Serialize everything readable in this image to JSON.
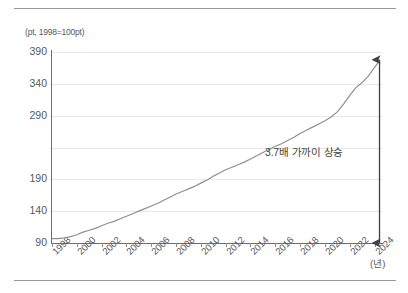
{
  "chart_data": {
    "type": "line",
    "title": "",
    "subtitle": "",
    "ylabel": "(pt, 1998=100pt)",
    "xlabel": "(년)",
    "xlim": [
      1998,
      2024.6
    ],
    "ylim": [
      90,
      390
    ],
    "grid": true,
    "legend": null,
    "y_ticks": [
      {
        "label": "390",
        "value": 390
      },
      {
        "label": "340",
        "value": 340
      },
      {
        "label": "290",
        "value": 290
      },
      {
        "label": "190",
        "value": 190
      },
      {
        "label": "140",
        "value": 140
      },
      {
        "label": "90",
        "value": 90
      }
    ],
    "y_gridline_values": [
      390,
      340,
      290,
      240,
      190,
      140,
      90
    ],
    "x_ticks": [
      "1998",
      "2000",
      "2002",
      "2004",
      "2006",
      "2008",
      "2010",
      "2012",
      "2014",
      "2016",
      "2018",
      "2020",
      "2022",
      "2024"
    ],
    "x_tick_values": [
      1998,
      2000,
      2002,
      2004,
      2006,
      2008,
      2010,
      2012,
      2014,
      2016,
      2018,
      2020,
      2022,
      2024
    ],
    "series": [
      {
        "name": "지수",
        "color": "#8f8f91",
        "x": [
          1998.0,
          1998.5,
          1999.0,
          1999.5,
          2000.0,
          2000.5,
          2001.0,
          2001.5,
          2002.0,
          2002.5,
          2003.0,
          2003.5,
          2004.0,
          2004.5,
          2005.0,
          2005.5,
          2006.0,
          2006.5,
          2007.0,
          2007.5,
          2008.0,
          2008.5,
          2009.0,
          2009.5,
          2010.0,
          2010.5,
          2011.0,
          2011.5,
          2012.0,
          2012.5,
          2013.0,
          2013.5,
          2014.0,
          2014.5,
          2015.0,
          2015.5,
          2016.0,
          2016.5,
          2017.0,
          2017.5,
          2018.0,
          2018.5,
          2019.0,
          2019.5,
          2020.0,
          2020.5,
          2021.0,
          2021.5,
          2022.0,
          2022.5,
          2023.0,
          2023.5,
          2024.0,
          2024.4
        ],
        "y": [
          97,
          97,
          98,
          100,
          103,
          107,
          110,
          113,
          117,
          121,
          124,
          128,
          132,
          136,
          140,
          144,
          148,
          152,
          157,
          162,
          167,
          171,
          175,
          179,
          184,
          189,
          195,
          200,
          205,
          209,
          213,
          217,
          222,
          227,
          232,
          237,
          242,
          246,
          251,
          256,
          262,
          267,
          272,
          277,
          282,
          288,
          296,
          308,
          322,
          334,
          342,
          352,
          366,
          376
        ]
      }
    ],
    "annotations": [
      {
        "name": "growth-callout",
        "text": "3.7배 가까이 상승",
        "x": 2021.0,
        "y": 205
      },
      {
        "name": "growth-arrow",
        "type": "double-headed-vertical-arrow",
        "x": 2024.4,
        "y_from": 90,
        "y_to": 378,
        "color": "#3f3f41"
      }
    ]
  }
}
